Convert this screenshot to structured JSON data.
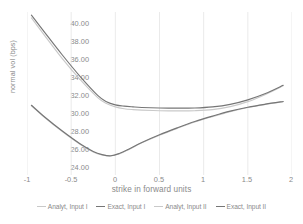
{
  "chart_data": {
    "type": "line",
    "title": "",
    "xlabel": "strike in forward units",
    "ylabel": "normal vol (bps)",
    "xlim": [
      -1,
      2
    ],
    "ylim": [
      23.2,
      41.2
    ],
    "xticks": [
      "-1",
      "-0.5",
      "0",
      "0.5",
      "1",
      "1.5",
      "2"
    ],
    "xtick_values": [
      -1,
      -0.5,
      0,
      0.5,
      1,
      1.5,
      2
    ],
    "yticks": [
      "24.00",
      "26.00",
      "28.00",
      "30.00",
      "32.00",
      "34.00",
      "36.00",
      "38.00",
      "40.00"
    ],
    "ytick_values": [
      24,
      26,
      28,
      30,
      32,
      34,
      36,
      38,
      40
    ],
    "grid": "vertical",
    "legend_position": "bottom",
    "series": [
      {
        "name": "Analyt, Input I",
        "color": "#c9c9c9",
        "x": [
          -0.95,
          -0.8,
          -0.6,
          -0.4,
          -0.2,
          -0.1,
          0.0,
          0.1,
          0.2,
          0.3,
          0.5,
          0.7,
          0.9,
          1.1,
          1.3,
          1.5,
          1.7,
          1.9
        ],
        "y": [
          40.55,
          38.6,
          36.05,
          33.75,
          31.75,
          31.1,
          30.72,
          30.52,
          30.42,
          30.36,
          30.3,
          30.28,
          30.3,
          30.42,
          30.75,
          31.3,
          32.1,
          33.05
        ]
      },
      {
        "name": "Exact, Input I",
        "color": "#767676",
        "x": [
          -0.95,
          -0.8,
          -0.6,
          -0.4,
          -0.2,
          -0.1,
          0.0,
          0.1,
          0.2,
          0.3,
          0.5,
          0.7,
          0.9,
          1.1,
          1.3,
          1.5,
          1.7,
          1.9
        ],
        "y": [
          40.85,
          38.95,
          36.45,
          34.1,
          32.0,
          31.3,
          30.95,
          30.8,
          30.72,
          30.66,
          30.6,
          30.58,
          30.6,
          30.72,
          31.0,
          31.5,
          32.2,
          33.1
        ]
      },
      {
        "name": "Analyt, Input II",
        "color": "#c9c9c9",
        "x": [
          -0.95,
          -0.8,
          -0.6,
          -0.4,
          -0.25,
          -0.15,
          -0.05,
          0.05,
          0.15,
          0.3,
          0.5,
          0.7,
          0.9,
          1.1,
          1.3,
          1.5,
          1.7,
          1.9
        ],
        "y": [
          30.85,
          29.55,
          28.0,
          26.6,
          25.75,
          25.42,
          25.3,
          25.55,
          26.0,
          26.75,
          27.6,
          28.35,
          29.05,
          29.65,
          30.2,
          30.65,
          31.0,
          31.3
        ]
      },
      {
        "name": "Exact, Input II",
        "color": "#767676",
        "x": [
          -0.95,
          -0.8,
          -0.6,
          -0.4,
          -0.25,
          -0.15,
          -0.05,
          0.05,
          0.15,
          0.3,
          0.5,
          0.7,
          0.9,
          1.1,
          1.3,
          1.5,
          1.7,
          1.9
        ],
        "y": [
          30.9,
          29.6,
          28.05,
          26.65,
          25.8,
          25.45,
          25.32,
          25.6,
          26.05,
          26.8,
          27.65,
          28.4,
          29.1,
          29.7,
          30.25,
          30.68,
          31.02,
          31.32
        ]
      }
    ]
  },
  "axes": {
    "y_title": "normal vol (bps)",
    "x_title": "strike in forward units",
    "y_tick_labels": [
      "40.00",
      "38.00",
      "36.00",
      "34.00",
      "32.00",
      "30.00",
      "28.00",
      "26.00",
      "24.00"
    ],
    "x_tick_labels": [
      "-1",
      "-0.5",
      "0",
      "0.5",
      "1",
      "1.5",
      "2"
    ]
  },
  "legend": {
    "items": [
      {
        "label": "Analyt, Input I",
        "color": "#c9c9c9"
      },
      {
        "label": "Exact, Input I",
        "color": "#767676"
      },
      {
        "label": "Analyt, Input II",
        "color": "#c9c9c9"
      },
      {
        "label": "Exact, Input II",
        "color": "#767676"
      }
    ]
  },
  "colors": {
    "grid": "#e4e4e4",
    "text": "#8a8a8a",
    "background": "#ffffff",
    "series_light": "#c9c9c9",
    "series_dark": "#767676"
  }
}
